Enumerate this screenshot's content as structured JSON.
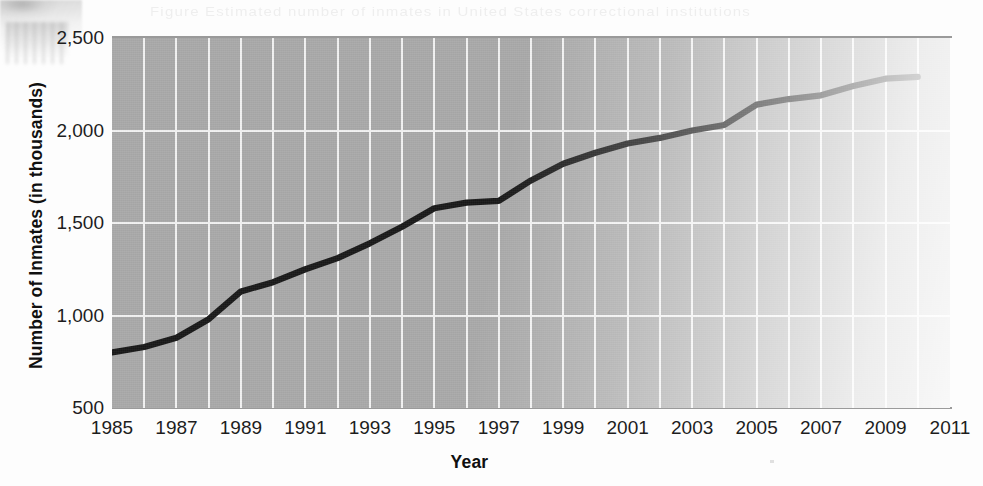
{
  "chart_data": {
    "type": "line",
    "title": "",
    "xlabel": "Year",
    "ylabel": "Number of Inmates (in thousands)",
    "xlim": [
      1985,
      2011
    ],
    "ylim": [
      500,
      2500
    ],
    "yticks": [
      "2,500",
      "2,000",
      "1,500",
      "1,000",
      "500"
    ],
    "ytick_values": [
      2500,
      2000,
      1500,
      1000,
      500
    ],
    "xticks": [
      "1985",
      "1987",
      "1989",
      "1991",
      "1993",
      "1995",
      "1997",
      "1999",
      "2001",
      "2003",
      "2005",
      "2007",
      "2009",
      "2011"
    ],
    "xtick_values": [
      1985,
      1987,
      1989,
      1991,
      1993,
      1995,
      1997,
      1999,
      2001,
      2003,
      2005,
      2007,
      2009,
      2011
    ],
    "grid": "vertical gridlines every 1 year, horizontal gridlines at every 500 tick",
    "legend": "none",
    "line_color": "#191919",
    "plot_background": "#a9a9a9",
    "gridline_color": "#f2f2f2",
    "x": [
      1985,
      1986,
      1987,
      1988,
      1989,
      1990,
      1991,
      1992,
      1993,
      1994,
      1995,
      1996,
      1997,
      1998,
      1999,
      2000,
      2001,
      2002,
      2003,
      2004,
      2005,
      2006,
      2007,
      2008,
      2009,
      2010
    ],
    "values": [
      800,
      830,
      880,
      980,
      1130,
      1180,
      1250,
      1310,
      1390,
      1480,
      1580,
      1610,
      1620,
      1730,
      1820,
      1880,
      1930,
      1960,
      2000,
      2030,
      2140,
      2170,
      2190,
      2240,
      2280,
      2290
    ],
    "annotations": []
  },
  "scan": {
    "bleed_text": "Figure   Estimated  number  of  inmates  in  United  States  correctional  institutions"
  }
}
